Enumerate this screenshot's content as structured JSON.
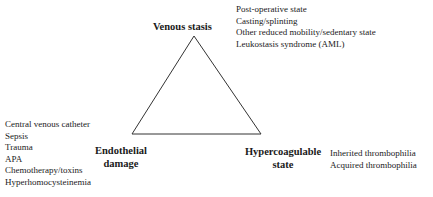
{
  "diagram": {
    "type": "triangle",
    "vertices": {
      "top": {
        "label": "Venous stasis",
        "factors": [
          "Post-operative state",
          "Casting/splinting",
          "Other reduced mobility/sedentary state",
          "Leukostasis syndrome (AML)"
        ]
      },
      "bottom_left": {
        "label_line1": "Endothelial",
        "label_line2": "damage",
        "factors": [
          "Central venous catheter",
          "Sepsis",
          "Trauma",
          "APA",
          "Chemotherapy/toxins",
          "Hyperhomocysteinemia"
        ]
      },
      "bottom_right": {
        "label_line1": "Hypercoagulable",
        "label_line2": "state",
        "factors": [
          "Inherited thrombophilia",
          "Acquired thrombophilia"
        ]
      }
    },
    "line_color": "#333333"
  }
}
